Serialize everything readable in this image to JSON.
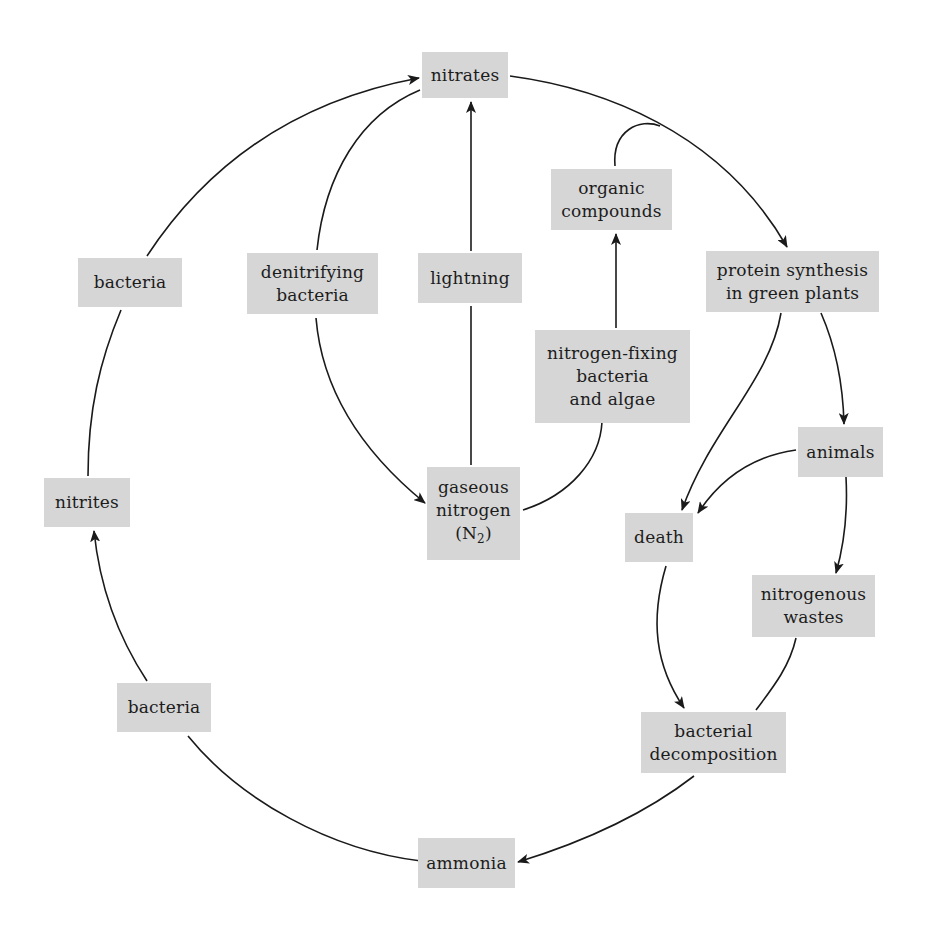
{
  "diagram": {
    "title": "",
    "type": "cycle",
    "colors": {
      "box_fill": "#d6d6d6",
      "text": "#1c1c1c",
      "line": "#1a1a1a",
      "background": "#ffffff"
    },
    "nodes": {
      "nitrates": {
        "lines": [
          "nitrates"
        ]
      },
      "organic_compounds": {
        "lines": [
          "organic",
          "compounds"
        ]
      },
      "protein_synthesis": {
        "lines": [
          "protein synthesis",
          "in green plants"
        ]
      },
      "bacteria_upper": {
        "lines": [
          "bacteria"
        ]
      },
      "denitrifying_bacteria": {
        "lines": [
          "denitrifying",
          "bacteria"
        ]
      },
      "lightning": {
        "lines": [
          "lightning"
        ]
      },
      "nitrogen_fixing": {
        "lines": [
          "nitrogen-fixing",
          "bacteria",
          "and algae"
        ]
      },
      "animals": {
        "lines": [
          "animals"
        ]
      },
      "gaseous_nitrogen": {
        "lines": [
          "gaseous",
          "nitrogen"
        ],
        "formula_open": "(N",
        "formula_sub": "2",
        "formula_close": ")"
      },
      "nitrites": {
        "lines": [
          "nitrites"
        ]
      },
      "death": {
        "lines": [
          "death"
        ]
      },
      "nitrogenous_wastes": {
        "lines": [
          "nitrogenous",
          "wastes"
        ]
      },
      "bacteria_lower": {
        "lines": [
          "bacteria"
        ]
      },
      "bacterial_decomposition": {
        "lines": [
          "bacterial",
          "decomposition"
        ]
      },
      "ammonia": {
        "lines": [
          "ammonia"
        ]
      }
    },
    "edges": [
      {
        "from": "nitrates",
        "to": "protein synthesis in green plants",
        "arrow": "end"
      },
      {
        "from": "organic compounds",
        "to": "nitrates→protein synthesis path",
        "arrow": "none"
      },
      {
        "from": "nitrogen-fixing bacteria and algae",
        "to": "organic compounds",
        "arrow": "end"
      },
      {
        "from": "gaseous nitrogen (N2)",
        "to": "nitrogen-fixing bacteria and algae",
        "arrow": "none"
      },
      {
        "from": "lightning",
        "to": "nitrates",
        "arrow": "end"
      },
      {
        "from": "gaseous nitrogen (N2)",
        "to": "lightning",
        "arrow": "none"
      },
      {
        "from": "nitrates",
        "to": "denitrifying bacteria",
        "arrow": "none"
      },
      {
        "from": "denitrifying bacteria",
        "to": "gaseous nitrogen (N2)",
        "arrow": "end"
      },
      {
        "from": "protein synthesis in green plants",
        "to": "animals",
        "arrow": "end"
      },
      {
        "from": "protein synthesis in green plants",
        "to": "death",
        "arrow": "end"
      },
      {
        "from": "animals",
        "to": "death",
        "arrow": "end"
      },
      {
        "from": "animals",
        "to": "nitrogenous wastes",
        "arrow": "end"
      },
      {
        "from": "death",
        "to": "bacterial decomposition",
        "arrow": "end"
      },
      {
        "from": "nitrogenous wastes",
        "to": "bacterial decomposition",
        "arrow": "none"
      },
      {
        "from": "bacterial decomposition",
        "to": "ammonia",
        "arrow": "end"
      },
      {
        "from": "ammonia",
        "to": "bacteria (lower)",
        "arrow": "none"
      },
      {
        "from": "bacteria (lower)",
        "to": "nitrites",
        "arrow": "end"
      },
      {
        "from": "nitrites",
        "to": "bacteria (upper)",
        "arrow": "none"
      },
      {
        "from": "bacteria (upper)",
        "to": "nitrates",
        "arrow": "end"
      }
    ]
  }
}
